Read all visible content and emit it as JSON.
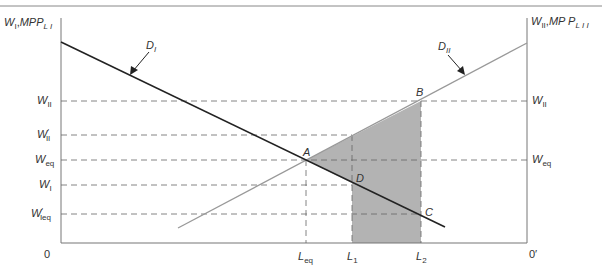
{
  "diagram": {
    "type": "two-sector labor market wage diagram",
    "left_axis_label": {
      "main": "W",
      "sub": "I",
      "sep": ",",
      "mpp": "MPP",
      "mpp_sub": "L I"
    },
    "right_axis_label": {
      "main": "W",
      "sub": "II",
      "sep": ",",
      "mpp": "MP P",
      "mpp_sub": "L I I"
    },
    "origin_left": "0",
    "origin_right": "0′",
    "curves": [
      {
        "id": "D_I",
        "label_main": "D",
        "label_sub": "I",
        "color": "#222222"
      },
      {
        "id": "D_II",
        "label_main": "D",
        "label_sub": "II",
        "color": "#999999"
      }
    ],
    "left_wage_labels": [
      {
        "main": "W",
        "sub": "II",
        "prime": ""
      },
      {
        "main": "W",
        "sub": "II",
        "prime": "′"
      },
      {
        "main": "W",
        "sub": "eq",
        "prime": ""
      },
      {
        "main": "W",
        "sub": "I",
        "prime": ""
      },
      {
        "main": "W",
        "sub": "Ieq",
        "prime": "′"
      }
    ],
    "right_wage_labels": [
      {
        "main": "W",
        "sub": "II"
      },
      {
        "main": "W",
        "sub": "eq"
      }
    ],
    "x_labels": [
      {
        "main": "L",
        "sub": "eq"
      },
      {
        "main": "L",
        "sub": "1"
      },
      {
        "main": "L",
        "sub": "2"
      }
    ],
    "points": [
      "A",
      "B",
      "C",
      "D"
    ],
    "shaded_area_color": "#b3b3b3"
  }
}
